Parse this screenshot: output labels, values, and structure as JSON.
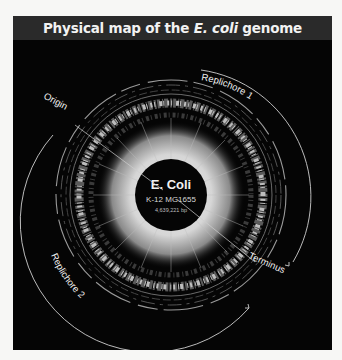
{
  "header": {
    "title_prefix": "Physical map of the ",
    "title_italic": "E. coli",
    "title_suffix": " genome"
  },
  "center": {
    "organism": "E. Coli",
    "strain": "K-12  MG1655",
    "size": "4,639,221 bp"
  },
  "labels": {
    "origin": "Origin",
    "terminus": "Terminus",
    "replichore1": "Replichore 1",
    "replichore2": "Replichore 2"
  },
  "colors": {
    "background": "#050505",
    "header": "#2a2a2a",
    "text": "#f2f2f2",
    "core_glow": "#d9d9d9",
    "arc": "#cfcfcf"
  }
}
